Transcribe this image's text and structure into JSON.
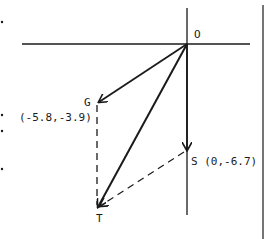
{
  "diagram": {
    "type": "vector-diagram",
    "origin_label": "O",
    "points": [
      {
        "id": "G",
        "label": "G",
        "coords_label": "(-5.8,-3.9)",
        "x": -5.8,
        "y": -3.9
      },
      {
        "id": "S",
        "label": "S",
        "coords_label": "S (0,-6.7)",
        "x": 0,
        "y": -6.7
      },
      {
        "id": "T",
        "label": "T"
      }
    ],
    "vectors": [
      {
        "from": "O",
        "to": "G",
        "style": "solid-arrow"
      },
      {
        "from": "O",
        "to": "S",
        "style": "solid-arrow"
      },
      {
        "from": "O",
        "to": "T",
        "style": "solid-arrow"
      },
      {
        "from": "G",
        "to": "T",
        "style": "dashed"
      },
      {
        "from": "S",
        "to": "T",
        "style": "dashed-arrow"
      }
    ],
    "colors": {
      "ink": "#1a1a1a",
      "background": "#ffffff"
    }
  }
}
